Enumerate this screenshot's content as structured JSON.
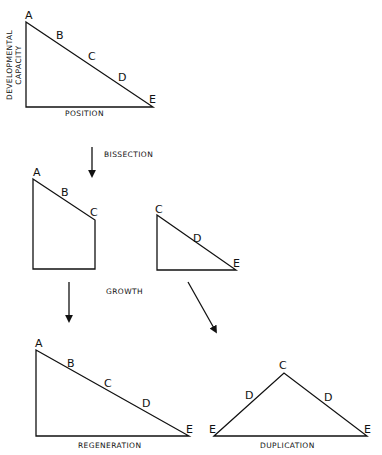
{
  "diagram": {
    "top": {
      "y_axis_label_line1": "DEVELOPMENTAL",
      "y_axis_label_line2": "CAPACITY",
      "x_axis_label": "POSITION",
      "vertices": [
        "A",
        "B",
        "C",
        "D",
        "E"
      ]
    },
    "bissection": {
      "label": "BISSECTION"
    },
    "left_piece": {
      "vertices": [
        "A",
        "B",
        "C"
      ]
    },
    "right_piece": {
      "vertices": [
        "C",
        "D",
        "E"
      ]
    },
    "growth": {
      "label": "GROWTH"
    },
    "regeneration": {
      "label": "REGENERATION",
      "vertices": [
        "A",
        "B",
        "C",
        "D",
        "E"
      ]
    },
    "duplication": {
      "label": "DUPLICATION",
      "vertices": [
        "E",
        "D",
        "C",
        "D",
        "E"
      ]
    }
  }
}
